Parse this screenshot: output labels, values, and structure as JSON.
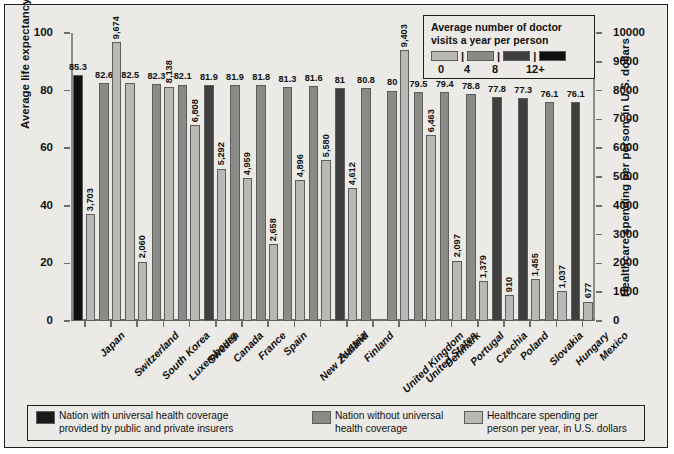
{
  "chart_data": {
    "type": "bar",
    "title": "",
    "xlabel": "",
    "ylabel_left": "Average life expectancy",
    "ylabel_right": "Healthcare spending per person, in U.S. dollars",
    "ylim_left": [
      0,
      100
    ],
    "ylim_right": [
      0,
      10000
    ],
    "yticks_left": [
      "0",
      "20",
      "40",
      "60",
      "80",
      "100"
    ],
    "yticks_right": [
      "0",
      "1000",
      "2000",
      "3000",
      "4000",
      "5000",
      "6000",
      "7000",
      "8000",
      "9000",
      "10000"
    ],
    "grid": false,
    "categories": [
      "Japan",
      "Switzerland",
      "South Korea",
      "Luxembourg",
      "Sweden",
      "Canada",
      "France",
      "Spain",
      "New Zealand",
      "Austria",
      "Finland",
      "United Kingdom",
      "United States",
      "Denmark",
      "Portugal",
      "Czechia",
      "Poland",
      "Slovakia",
      "Hungary",
      "Mexico"
    ],
    "series": [
      {
        "name": "Average life expectancy",
        "axis": "left",
        "values": [
          85.3,
          82.6,
          82.5,
          82.3,
          82.1,
          81.9,
          81.9,
          81.8,
          81.3,
          81.6,
          81,
          80.8,
          80,
          79.5,
          79.4,
          78.8,
          77.8,
          77.3,
          76.1,
          76.1
        ],
        "labels": [
          "85.3",
          "82.6",
          "82.5",
          "82.3",
          "82.1",
          "81.9",
          "81.9",
          "81.8",
          "81.3",
          "81.6",
          "81",
          "80.8",
          "80",
          "79.5",
          "79.4",
          "78.8",
          "77.8",
          "77.3",
          "76.1",
          "76.1"
        ],
        "visit_bucket": [
          3,
          1,
          0,
          1,
          1,
          2,
          1,
          1,
          1,
          1,
          2,
          1,
          1,
          1,
          1,
          1,
          2,
          2,
          1,
          2
        ]
      },
      {
        "name": "Healthcare spending per person, in U.S. dollars",
        "axis": "right",
        "values": [
          3703,
          9674,
          2060,
          8138,
          6808,
          5292,
          4959,
          2658,
          4896,
          5580,
          4612,
          0,
          9403,
          6463,
          2097,
          1379,
          910,
          1455,
          1037,
          677
        ],
        "labels": [
          "3,703",
          "9,674",
          "2,060",
          "8,138",
          "6,808",
          "5,292",
          "4,959",
          "2,658",
          "4,896",
          "5,580",
          "4,612",
          "",
          "9,403",
          "6,463",
          "2,097",
          "1,379",
          "910",
          "1,455",
          "1,037",
          "677"
        ]
      }
    ]
  },
  "doctor_visits_legend": {
    "title_line1": "Average number of doctor",
    "title_line2": "visits a year per person",
    "ticks": [
      "0",
      "4",
      "8",
      "12+"
    ],
    "separator": "|",
    "colors": [
      "#b9b8b4",
      "#8a8a86",
      "#3f3f3f",
      "#101010"
    ]
  },
  "bottom_legend": {
    "items": [
      {
        "swatch": "#1a1a1a",
        "line1": "Nation with universal health coverage",
        "line2": "provided by public and private insurers"
      },
      {
        "swatch": "#8a8a86",
        "line1": "Nation without universal",
        "line2": "health coverage"
      },
      {
        "swatch": "#b9b8b4",
        "line1": "Healthcare spending per",
        "line2": "person per year, in U.S. dollars"
      }
    ]
  },
  "colors": {
    "background": "#eceae6",
    "border": "#231f20",
    "spend_bar": "#b9b8b4",
    "axis": "#6d6d6d"
  }
}
